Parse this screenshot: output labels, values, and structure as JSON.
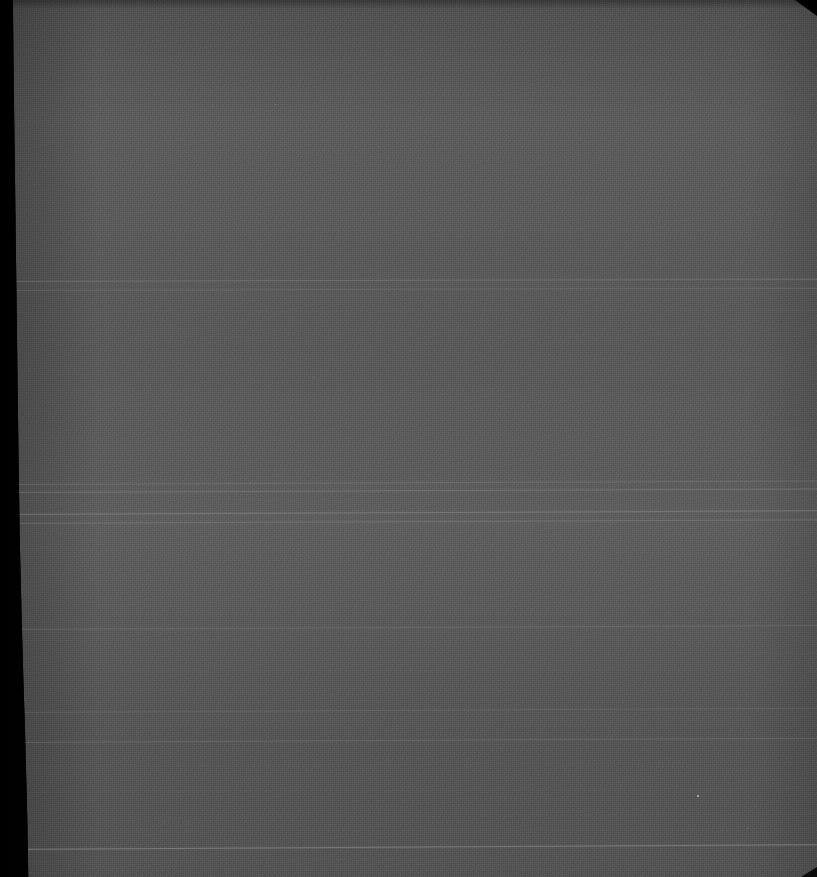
{
  "image": {
    "kind": "scanned-document-frame",
    "title": "Underexposed scanned page",
    "width": 817,
    "height": 877,
    "description": "Severely underexposed archival scan: near-black left border band with a skewed inner edge, large noisy mid-gray paper field, faint tilted horizontal scan lines, clipped top-right corner."
  },
  "colors": {
    "background": "#000000",
    "paper_gray": "#585858",
    "dark_band": "#030303",
    "line_bright": "#9a9a9a",
    "line_faint": "#6a6a6a"
  },
  "regions": {
    "dark_band": {
      "name": "left-dark-border",
      "top_width_px": 75,
      "bottom_width_px": 97
    },
    "paper": {
      "name": "paper-field",
      "mean_gray": "#585858"
    }
  },
  "scan_lines": [
    {
      "y": 88,
      "opacity": 0.14,
      "thickness": 1,
      "tilt": -0.12,
      "bright": false
    },
    {
      "y": 96,
      "opacity": 0.1,
      "thickness": 1,
      "tilt": -0.12,
      "bright": false
    },
    {
      "y": 158,
      "opacity": 0.13,
      "thickness": 1,
      "tilt": -0.14,
      "bright": false
    },
    {
      "y": 166,
      "opacity": 0.09,
      "thickness": 1,
      "tilt": -0.14,
      "bright": false
    },
    {
      "y": 281,
      "opacity": 0.3,
      "thickness": 1,
      "tilt": -0.16,
      "bright": true
    },
    {
      "y": 290,
      "opacity": 0.2,
      "thickness": 1,
      "tilt": -0.16,
      "bright": true
    },
    {
      "y": 312,
      "opacity": 0.16,
      "thickness": 1,
      "tilt": -0.2,
      "bright": false
    },
    {
      "y": 330,
      "opacity": 0.12,
      "thickness": 1,
      "tilt": -0.2,
      "bright": false
    },
    {
      "y": 338,
      "opacity": 0.09,
      "thickness": 1,
      "tilt": -0.2,
      "bright": false
    },
    {
      "y": 380,
      "opacity": 0.07,
      "thickness": 1,
      "tilt": -0.22,
      "bright": false
    },
    {
      "y": 437,
      "opacity": 0.11,
      "thickness": 1,
      "tilt": -0.22,
      "bright": false
    },
    {
      "y": 455,
      "opacity": 0.08,
      "thickness": 1,
      "tilt": -0.22,
      "bright": false
    },
    {
      "y": 484,
      "opacity": 0.26,
      "thickness": 1,
      "tilt": -0.24,
      "bright": true
    },
    {
      "y": 492,
      "opacity": 0.34,
      "thickness": 1,
      "tilt": -0.24,
      "bright": true
    },
    {
      "y": 500,
      "opacity": 0.18,
      "thickness": 1,
      "tilt": -0.24,
      "bright": false
    },
    {
      "y": 514,
      "opacity": 0.42,
      "thickness": 1,
      "tilt": -0.26,
      "bright": true
    },
    {
      "y": 523,
      "opacity": 0.3,
      "thickness": 1,
      "tilt": -0.26,
      "bright": true
    },
    {
      "y": 548,
      "opacity": 0.13,
      "thickness": 1,
      "tilt": -0.26,
      "bright": false
    },
    {
      "y": 556,
      "opacity": 0.09,
      "thickness": 1,
      "tilt": -0.26,
      "bright": false
    },
    {
      "y": 595,
      "opacity": 0.07,
      "thickness": 1,
      "tilt": -0.26,
      "bright": false
    },
    {
      "y": 629,
      "opacity": 0.22,
      "thickness": 1,
      "tilt": -0.28,
      "bright": true
    },
    {
      "y": 640,
      "opacity": 0.16,
      "thickness": 1,
      "tilt": -0.28,
      "bright": false
    },
    {
      "y": 657,
      "opacity": 0.13,
      "thickness": 1,
      "tilt": -0.28,
      "bright": false
    },
    {
      "y": 672,
      "opacity": 0.11,
      "thickness": 1,
      "tilt": -0.28,
      "bright": false
    },
    {
      "y": 686,
      "opacity": 0.09,
      "thickness": 1,
      "tilt": -0.28,
      "bright": false
    },
    {
      "y": 712,
      "opacity": 0.19,
      "thickness": 1,
      "tilt": -0.3,
      "bright": true
    },
    {
      "y": 742,
      "opacity": 0.24,
      "thickness": 1,
      "tilt": -0.3,
      "bright": true
    },
    {
      "y": 766,
      "opacity": 0.13,
      "thickness": 1,
      "tilt": -0.3,
      "bright": false
    },
    {
      "y": 792,
      "opacity": 0.15,
      "thickness": 1,
      "tilt": -0.32,
      "bright": false
    },
    {
      "y": 818,
      "opacity": 0.12,
      "thickness": 1,
      "tilt": -0.32,
      "bright": false
    },
    {
      "y": 832,
      "opacity": 0.1,
      "thickness": 1,
      "tilt": -0.32,
      "bright": false
    },
    {
      "y": 849,
      "opacity": 0.52,
      "thickness": 1,
      "tilt": -0.34,
      "bright": true
    },
    {
      "y": 861,
      "opacity": 0.12,
      "thickness": 1,
      "tilt": -0.34,
      "bright": false
    },
    {
      "y": 872,
      "opacity": 0.09,
      "thickness": 1,
      "tilt": -0.34,
      "bright": false
    }
  ],
  "specks": [
    {
      "x": 697,
      "y": 795,
      "size": 2,
      "color": "#c8c8c8"
    },
    {
      "x": 275,
      "y": 104,
      "size": 1,
      "color": "#8e8e8e"
    },
    {
      "x": 313,
      "y": 377,
      "size": 1,
      "color": "#8a8a8a"
    },
    {
      "x": 747,
      "y": 828,
      "size": 1,
      "color": "#909090"
    }
  ]
}
